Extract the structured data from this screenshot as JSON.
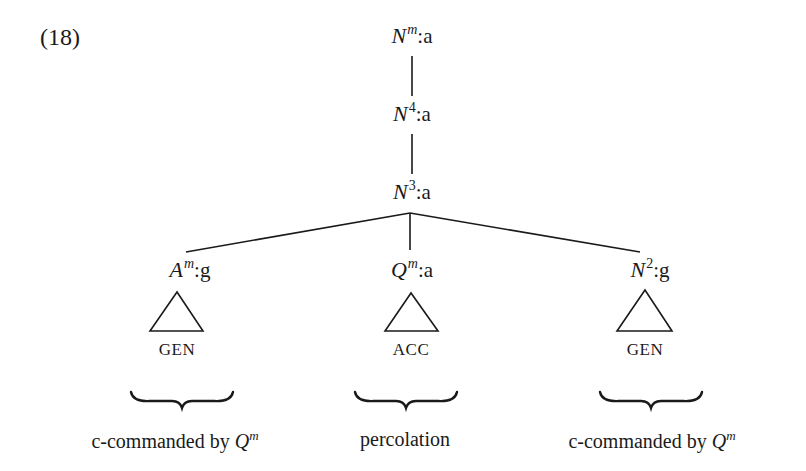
{
  "example_number": "(18)",
  "tree": {
    "root": {
      "category": "N",
      "bar": "m",
      "case": "a"
    },
    "level2": {
      "category": "N",
      "bar": "4",
      "case": "a"
    },
    "level3": {
      "category": "N",
      "bar": "3",
      "case": "a"
    },
    "children": [
      {
        "category": "A",
        "bar": "m",
        "case": "g",
        "leaf": "GEN",
        "annotation": "c-commanded by",
        "annotation_symbol": "Q",
        "annotation_sup": "m"
      },
      {
        "category": "Q",
        "bar": "m",
        "case": "a",
        "leaf": "ACC",
        "annotation": "percolation",
        "annotation_symbol": "",
        "annotation_sup": ""
      },
      {
        "category": "N",
        "bar": "2",
        "case": "g",
        "leaf": "GEN",
        "annotation": "c-commanded by",
        "annotation_symbol": "Q",
        "annotation_sup": "m"
      }
    ]
  },
  "colors": {
    "ink": "#1a1a1a",
    "background": "#ffffff"
  }
}
